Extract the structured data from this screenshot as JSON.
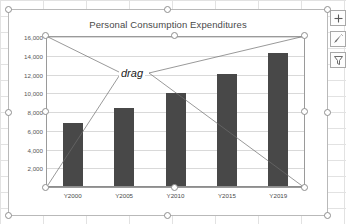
{
  "app": {
    "context": "excel-chart-selected"
  },
  "chart": {
    "title": "Personal Consumption Expenditures",
    "annotation": "drag",
    "plot_area_selected": true
  },
  "chart_buttons": [
    {
      "name": "chart-elements-button",
      "icon": "plus-icon",
      "label": "+"
    },
    {
      "name": "chart-styles-button",
      "icon": "paintbrush-icon",
      "label": ""
    },
    {
      "name": "chart-filters-button",
      "icon": "funnel-icon",
      "label": ""
    }
  ],
  "chart_data": {
    "type": "bar",
    "title": "Personal Consumption Expenditures",
    "categories": [
      "Y2000",
      "Y2005",
      "Y2010",
      "Y2015",
      "Y2019"
    ],
    "values": [
      6800,
      8400,
      10000,
      12100,
      14300
    ],
    "xlabel": "",
    "ylabel": "",
    "ylim": [
      0,
      16000
    ],
    "yticks": [
      "2,000",
      "4,000",
      "6,000",
      "8,000",
      "10,000",
      "12,000",
      "14,000",
      "16,000"
    ],
    "ytick_values": [
      2000,
      4000,
      6000,
      8000,
      10000,
      12000,
      14000,
      16000
    ],
    "grid": true,
    "legend": "none",
    "bar_color": "#484848"
  }
}
